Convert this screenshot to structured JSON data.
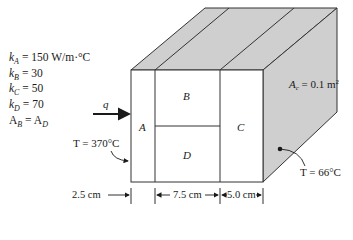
{
  "figure": {
    "type": "composite-wall-heat-conduction",
    "properties": [
      {
        "symbol": "k",
        "sub": "A",
        "value": "150 W/m·°C"
      },
      {
        "symbol": "k",
        "sub": "B",
        "value": "30"
      },
      {
        "symbol": "k",
        "sub": "C",
        "value": "50"
      },
      {
        "symbol": "k",
        "sub": "D",
        "value": "70"
      }
    ],
    "area_relation": {
      "lhs": "A",
      "lhs_sub": "B",
      "rhs": "A",
      "rhs_sub": "D"
    },
    "heat_flow_label": "q",
    "layers": {
      "A": "A",
      "B": "B",
      "C": "C",
      "D": "D"
    },
    "area_label": "A",
    "area_label_sub": "c",
    "area_value": " = 0.1 m",
    "area_exp": "2",
    "hot_side_temp": "T = 370°C",
    "cold_side_temp": "T = 66°C",
    "dimensions": {
      "A": "2.5 cm",
      "BD": "7.5 cm",
      "C": "5.0 cm"
    },
    "colors": {
      "shade": "#cfcfcf",
      "line": "#333333"
    }
  }
}
